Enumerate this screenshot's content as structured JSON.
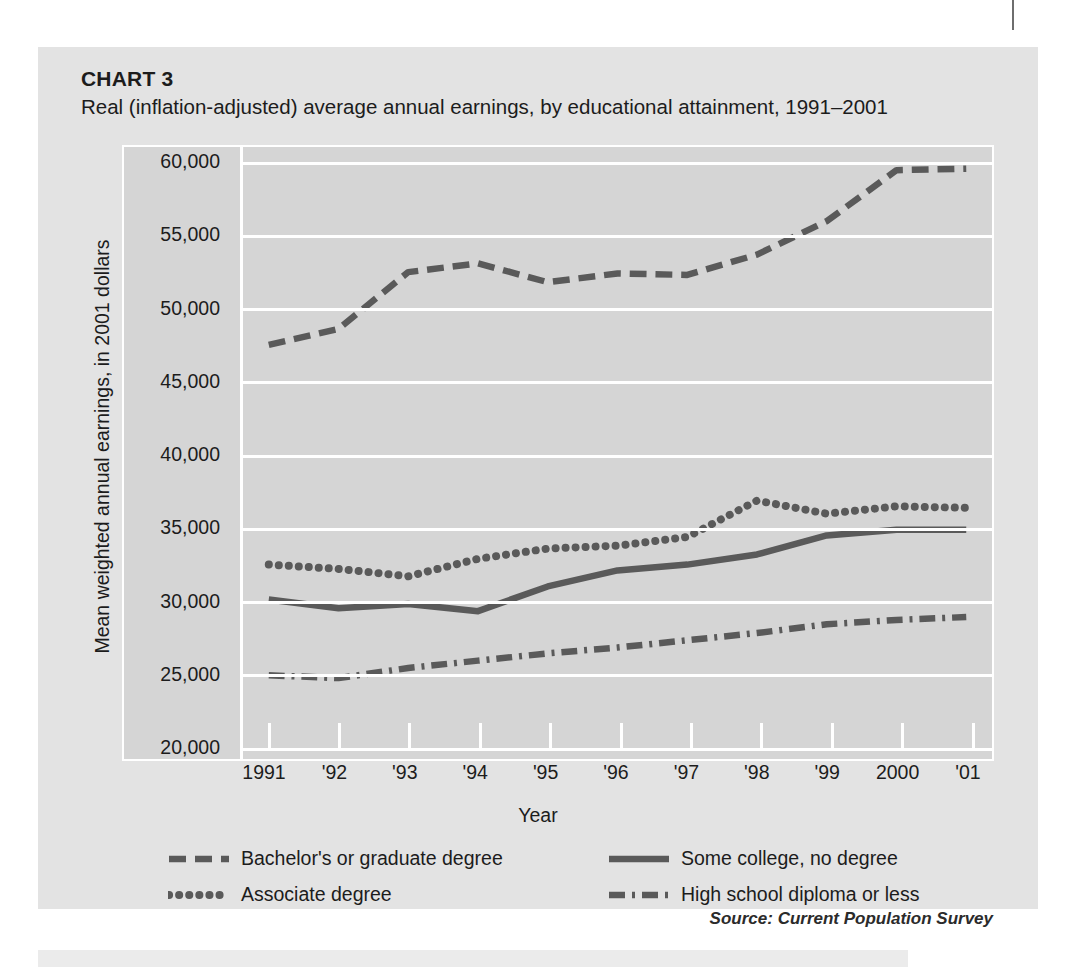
{
  "card": {
    "chart_label": "CHART 3",
    "subtitle": "Real (inflation-adjusted) average annual earnings, by educational attainment, 1991–2001",
    "source": "Source: Current Population Survey",
    "background": "#e3e3e3",
    "plot_background": "#d5d5d5",
    "gridline_color": "#ffffff",
    "series_color": "#5a5a5a"
  },
  "chart_data": {
    "type": "line",
    "title": "Real (inflation-adjusted) average annual earnings, by educational attainment, 1991–2001",
    "xlabel": "Year",
    "ylabel": "Mean weighted annual earnings, in 2001 dollars",
    "categories": [
      "1991",
      "'92",
      "'93",
      "'94",
      "'95",
      "'96",
      "'97",
      "'98",
      "'99",
      "2000",
      "'01"
    ],
    "x": [
      1991,
      1992,
      1993,
      1994,
      1995,
      1996,
      1997,
      1998,
      1999,
      2000,
      2001
    ],
    "ylim": [
      20000,
      60000
    ],
    "yticks": [
      20000,
      25000,
      30000,
      35000,
      40000,
      45000,
      50000,
      55000,
      60000
    ],
    "ytick_labels": [
      "20,000",
      "25,000",
      "30,000",
      "35,000",
      "40,000",
      "45,000",
      "50,000",
      "55,000",
      "60,000"
    ],
    "grid": true,
    "legend_position": "below",
    "series": [
      {
        "name": "Bachelor's or graduate degree",
        "style": "dashed",
        "color": "#5a5a5a",
        "values": [
          47500,
          48600,
          52500,
          53100,
          51800,
          52400,
          52300,
          53700,
          56000,
          59500,
          59600
        ]
      },
      {
        "name": "Associate degree",
        "style": "dotted",
        "color": "#5a5a5a",
        "values": [
          32400,
          32100,
          31600,
          32800,
          33500,
          33700,
          34300,
          36800,
          35900,
          36400,
          36300
        ]
      },
      {
        "name": "Some college, no degree",
        "style": "solid",
        "color": "#5a5a5a",
        "values": [
          30000,
          29400,
          29700,
          29200,
          30900,
          32000,
          32400,
          33100,
          34400,
          34800,
          34800
        ]
      },
      {
        "name": "High school diploma or less",
        "style": "dash-dot",
        "color": "#5a5a5a",
        "values": [
          24800,
          24600,
          25300,
          25800,
          26300,
          26700,
          27200,
          27700,
          28300,
          28600,
          28800
        ]
      }
    ]
  },
  "legend": [
    {
      "label": "Bachelor's or graduate degree",
      "style": "dashed"
    },
    {
      "label": "Associate degree",
      "style": "dotted"
    },
    {
      "label": "Some college, no degree",
      "style": "solid"
    },
    {
      "label": "High school diploma or less",
      "style": "dash-dot"
    }
  ]
}
